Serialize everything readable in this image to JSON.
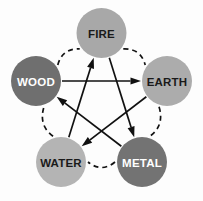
{
  "diagram": {
    "background_color": "#fdfdfd",
    "center": {
      "x": 101.5,
      "y": 100.5
    },
    "node_radius": 25,
    "ring_radius": 78,
    "nodes": [
      {
        "id": "fire",
        "label": "FIRE",
        "x": 101.5,
        "y": 33,
        "fill": "#a8a8a8",
        "text_color": "#1a1a1a",
        "icon": "fire-node-icon"
      },
      {
        "id": "earth",
        "label": "EARTH",
        "x": 167,
        "y": 81,
        "fill": "#acacac",
        "text_color": "#1a1a1a",
        "icon": "earth-node-icon"
      },
      {
        "id": "metal",
        "label": "METAL",
        "x": 142,
        "y": 162,
        "fill": "#737373",
        "text_color": "#ffffff",
        "icon": "metal-node-icon"
      },
      {
        "id": "water",
        "label": "WATER",
        "x": 61,
        "y": 162,
        "fill": "#b4b4b4",
        "text_color": "#1a1a1a",
        "icon": "water-node-icon"
      },
      {
        "id": "wood",
        "label": "WOOD",
        "x": 36,
        "y": 81,
        "fill": "#6f6f6f",
        "text_color": "#ffffff",
        "icon": "wood-node-icon"
      }
    ],
    "generating_cycle": {
      "name": "generating-cycle",
      "style": "dashed",
      "color": "#121212",
      "edges": [
        {
          "from": "fire",
          "to": "earth"
        },
        {
          "from": "earth",
          "to": "metal"
        },
        {
          "from": "metal",
          "to": "water"
        },
        {
          "from": "water",
          "to": "wood"
        },
        {
          "from": "wood",
          "to": "fire"
        }
      ]
    },
    "overcoming_cycle": {
      "name": "overcoming-cycle",
      "style": "solid-arrow",
      "color": "#111111",
      "edges": [
        {
          "from": "wood",
          "to": "earth"
        },
        {
          "from": "earth",
          "to": "water"
        },
        {
          "from": "water",
          "to": "fire"
        },
        {
          "from": "fire",
          "to": "metal"
        },
        {
          "from": "metal",
          "to": "wood"
        }
      ]
    }
  }
}
